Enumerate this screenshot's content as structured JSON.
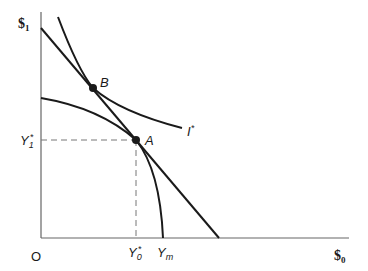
{
  "diagram": {
    "axes": {
      "y_label": "$",
      "y_label_sub": "1",
      "x_label": "$",
      "x_label_sub": "0",
      "origin_label": "O"
    },
    "points": {
      "A": {
        "label": "A"
      },
      "B": {
        "label": "B"
      }
    },
    "curves": {
      "indifference": {
        "label": "I",
        "label_sup": "*"
      },
      "ppc_intercept": {
        "label": "Y",
        "label_sub": "m"
      }
    },
    "guides": {
      "y1": {
        "label": "Y",
        "label_sub": "1",
        "label_sup": "*"
      },
      "y0": {
        "label": "Y",
        "label_sub": "0",
        "label_sup": "*"
      }
    },
    "colors": {
      "line": "#1a1a1a",
      "axis": "#555555",
      "dash": "#777777"
    }
  }
}
